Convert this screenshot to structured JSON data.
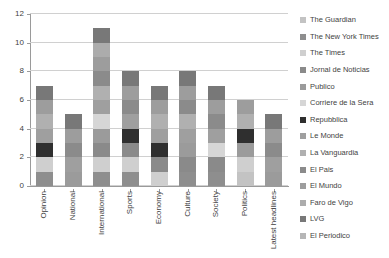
{
  "chart_data": {
    "type": "bar",
    "subtype": "stacked-column",
    "title": "",
    "xlabel": "",
    "ylabel": "",
    "ylim": [
      0,
      12
    ],
    "ytick_step": 2,
    "yticks": [
      0,
      2,
      4,
      6,
      8,
      10,
      12
    ],
    "grid": true,
    "legend_position": "right",
    "categories": [
      "Opinion",
      "National",
      "International",
      "Sports",
      "Economy",
      "Culture",
      "Society",
      "Politics",
      "Latest headlines"
    ],
    "category_totals": [
      7,
      5,
      11,
      8,
      7,
      8,
      7,
      6,
      5
    ],
    "series": [
      {
        "name": "The Guardian",
        "color": "#c3c3c3",
        "values": [
          0,
          0,
          0,
          0,
          0,
          0,
          0,
          1,
          0
        ]
      },
      {
        "name": "The New York Times",
        "color": "#8e8e8e",
        "values": [
          1,
          0,
          1,
          1,
          0,
          1,
          1,
          0,
          0
        ]
      },
      {
        "name": "The Times",
        "color": "#cfcfcf",
        "values": [
          1,
          0,
          1,
          1,
          1,
          0,
          0,
          1,
          0
        ]
      },
      {
        "name": "Jornal de Noticias",
        "color": "#8a8a8a",
        "values": [
          0,
          0,
          1,
          1,
          1,
          1,
          1,
          0,
          0
        ]
      },
      {
        "name": "Publico",
        "color": "#9b9b9b",
        "values": [
          0,
          1,
          1,
          0,
          0,
          1,
          0,
          1,
          1
        ]
      },
      {
        "name": "Corriere de la Sera",
        "color": "#d6d6d6",
        "values": [
          0,
          0,
          1,
          0,
          0,
          0,
          1,
          0,
          0
        ]
      },
      {
        "name": "Repubblica",
        "color": "#2f2f2f",
        "values": [
          1,
          0,
          0,
          1,
          1,
          0,
          0,
          1,
          0
        ]
      },
      {
        "name": "Le Monde",
        "color": "#9f9f9f",
        "values": [
          1,
          1,
          1,
          1,
          1,
          1,
          1,
          0,
          1
        ]
      },
      {
        "name": "La Vanguardia",
        "color": "#b0b0b0",
        "values": [
          1,
          0,
          1,
          0,
          1,
          1,
          0,
          1,
          0
        ]
      },
      {
        "name": "El Pais",
        "color": "#8b8b8b",
        "values": [
          0,
          1,
          1,
          1,
          0,
          1,
          1,
          0,
          1
        ]
      },
      {
        "name": "El Mundo",
        "color": "#9d9d9d",
        "values": [
          1,
          1,
          1,
          1,
          1,
          1,
          1,
          1,
          1
        ]
      },
      {
        "name": "Faro de Vigo",
        "color": "#acacac",
        "values": [
          0,
          0,
          1,
          0,
          0,
          0,
          0,
          0,
          0
        ]
      },
      {
        "name": "LVG",
        "color": "#787878",
        "values": [
          1,
          1,
          1,
          1,
          1,
          1,
          1,
          0,
          1
        ]
      },
      {
        "name": "El Periodico",
        "color": "#b6b6b6",
        "values": [
          0,
          0,
          0,
          0,
          0,
          0,
          0,
          0,
          0
        ]
      }
    ]
  },
  "axis": {
    "ytick_labels": [
      "12",
      "10",
      "8",
      "6",
      "4",
      "2",
      "0"
    ]
  },
  "colors": {
    "gridline": "#d0d0d0",
    "axis": "#9a9a9a",
    "text": "#3f3f3f",
    "background": "#ffffff"
  }
}
